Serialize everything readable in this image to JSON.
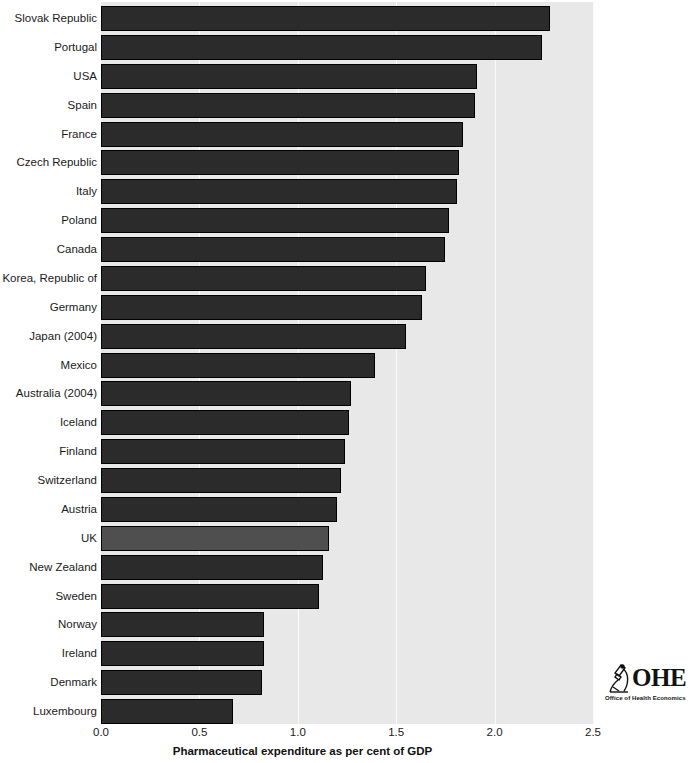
{
  "chart_data": {
    "type": "bar",
    "orientation": "horizontal",
    "title": "",
    "xlabel": "Pharmaceutical expenditure as per cent of GDP",
    "ylabel": "",
    "xlim": [
      0.0,
      2.5
    ],
    "xticks": [
      "0.0",
      "0.5",
      "1.0",
      "1.5",
      "2.0",
      "2.5"
    ],
    "xtick_values": [
      0.0,
      0.5,
      1.0,
      1.5,
      2.0,
      2.5
    ],
    "grid": "vertical",
    "legend": "none",
    "categories": [
      "Slovak Republic",
      "Portugal",
      "USA",
      "Spain",
      "France",
      "Czech Republic",
      "Italy",
      "Poland",
      "Canada",
      "Korea, Republic of",
      "Germany",
      "Japan (2004)",
      "Mexico",
      "Australia (2004)",
      "Iceland",
      "Finland",
      "Switzerland",
      "Austria",
      "UK",
      "New Zealand",
      "Sweden",
      "Norway",
      "Ireland",
      "Denmark",
      "Luxembourg"
    ],
    "values": [
      2.28,
      2.24,
      1.91,
      1.9,
      1.84,
      1.82,
      1.81,
      1.77,
      1.75,
      1.65,
      1.63,
      1.55,
      1.39,
      1.27,
      1.26,
      1.24,
      1.22,
      1.2,
      1.16,
      1.13,
      1.11,
      0.83,
      0.83,
      0.82,
      0.67
    ],
    "highlight_category": "UK",
    "colors": {
      "bar": "#2b2b2b",
      "bar_highlight": "#4f4f4f",
      "bar_outline": "#000000",
      "plot_background": "#e8e8e8",
      "gridline": "#fbfbfb",
      "figure_background": "#ffffff",
      "text": "#1a1a1a"
    }
  },
  "logo": {
    "wordmark": "OHE",
    "subtitle": "Office of Health Economics",
    "mark": "microscope-icon"
  }
}
